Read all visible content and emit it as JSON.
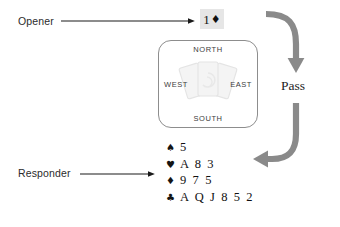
{
  "labels": {
    "opener": "Opener",
    "responder": "Responder",
    "pass": "Pass"
  },
  "bid": {
    "level": "1",
    "suit_symbol": "♦",
    "suit_name": "diamonds",
    "full": "1♦"
  },
  "compass": {
    "north": "NORTH",
    "south": "SOUTH",
    "west": "WEST",
    "east": "EAST",
    "watermark": "fanned-cards-watermark"
  },
  "hand": {
    "rows": [
      {
        "suit_symbol": "♠",
        "suit_name": "spades",
        "cards": "5"
      },
      {
        "suit_symbol": "♥",
        "suit_name": "hearts",
        "cards": "A 8 3"
      },
      {
        "suit_symbol": "♦",
        "suit_name": "diamonds",
        "cards": "9 7 5"
      },
      {
        "suit_symbol": "♣",
        "suit_name": "clubs",
        "cards": "A Q J 8 5 2"
      }
    ]
  },
  "arrows": {
    "opener_pointer": "thin-black-arrow-right",
    "responder_pointer": "thin-black-arrow-right",
    "pass_in": "thick-gray-curved-arrow-down",
    "pass_out": "thick-gray-curved-arrow-left"
  },
  "colors": {
    "ink": "#1d1d1d",
    "thin_arrow": "#1a1a1a",
    "thick_arrow": "#8a8a8a",
    "chip_background": "#e6e6e6",
    "box_border": "#8d8d8d",
    "watermark": "#eeeeee"
  }
}
